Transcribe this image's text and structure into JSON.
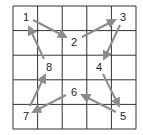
{
  "diagram": {
    "grid": {
      "rows": 5,
      "cols": 5,
      "left": 13,
      "top": 6,
      "cell": 24.6,
      "line_color": "#333333"
    },
    "arrow_color": "#8c8c8c",
    "label_color": "#222222",
    "points": [
      {
        "id": "1",
        "label": "1",
        "x": 26,
        "y": 17
      },
      {
        "id": "2",
        "label": "2",
        "x": 74,
        "y": 42
      },
      {
        "id": "3",
        "label": "3",
        "x": 123,
        "y": 17
      },
      {
        "id": "4",
        "label": "4",
        "x": 99,
        "y": 67
      },
      {
        "id": "5",
        "label": "5",
        "x": 123,
        "y": 116
      },
      {
        "id": "6",
        "label": "6",
        "x": 74,
        "y": 92
      },
      {
        "id": "7",
        "label": "7",
        "x": 26,
        "y": 116
      },
      {
        "id": "8",
        "label": "8",
        "x": 49,
        "y": 67
      }
    ],
    "arrows": [
      {
        "from": "1",
        "to": "2",
        "x1": 33,
        "y1": 20,
        "x2": 66,
        "y2": 37
      },
      {
        "from": "2",
        "to": "3",
        "x1": 82,
        "y1": 37,
        "x2": 115,
        "y2": 20
      },
      {
        "from": "3",
        "to": "4",
        "x1": 120,
        "y1": 25,
        "x2": 104,
        "y2": 59
      },
      {
        "from": "4",
        "to": "5",
        "x1": 103,
        "y1": 74,
        "x2": 119,
        "y2": 106
      },
      {
        "from": "5",
        "to": "6",
        "x1": 116,
        "y1": 112,
        "x2": 82,
        "y2": 95
      },
      {
        "from": "6",
        "to": "7",
        "x1": 66,
        "y1": 95,
        "x2": 33,
        "y2": 112
      },
      {
        "from": "7",
        "to": "8",
        "x1": 30,
        "y1": 106,
        "x2": 45,
        "y2": 75
      },
      {
        "from": "8",
        "to": "1",
        "x1": 44,
        "y1": 59,
        "x2": 29,
        "y2": 27
      }
    ]
  }
}
